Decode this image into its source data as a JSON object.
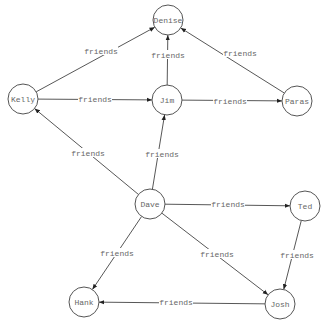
{
  "diagram": {
    "type": "directed-graph",
    "nodes": [
      {
        "id": "denise",
        "label": "Denise",
        "x": 168,
        "y": 20,
        "r": 15
      },
      {
        "id": "kelly",
        "label": "Kelly",
        "x": 23,
        "y": 99,
        "r": 15
      },
      {
        "id": "jim",
        "label": "Jim",
        "x": 167,
        "y": 100,
        "r": 15
      },
      {
        "id": "paras",
        "label": "Paras",
        "x": 297,
        "y": 101,
        "r": 15
      },
      {
        "id": "dave",
        "label": "Dave",
        "x": 150,
        "y": 204,
        "r": 15
      },
      {
        "id": "ted",
        "label": "Ted",
        "x": 305,
        "y": 206,
        "r": 15
      },
      {
        "id": "hank",
        "label": "Hank",
        "x": 84,
        "y": 302,
        "r": 15
      },
      {
        "id": "josh",
        "label": "Josh",
        "x": 280,
        "y": 304,
        "r": 15
      }
    ],
    "edges": [
      {
        "from": "kelly",
        "to": "denise",
        "label": "friends",
        "lx": 101,
        "ly": 51
      },
      {
        "from": "jim",
        "to": "denise",
        "label": "friends",
        "lx": 168,
        "ly": 55
      },
      {
        "from": "paras",
        "to": "denise",
        "label": "friends",
        "lx": 240,
        "ly": 53
      },
      {
        "from": "kelly",
        "to": "jim",
        "label": "friends",
        "lx": 95,
        "ly": 99
      },
      {
        "from": "jim",
        "to": "paras",
        "label": "friends",
        "lx": 230,
        "ly": 101
      },
      {
        "from": "dave",
        "to": "kelly",
        "label": "friends",
        "lx": 88,
        "ly": 153
      },
      {
        "from": "dave",
        "to": "jim",
        "label": "friends",
        "lx": 162,
        "ly": 154
      },
      {
        "from": "dave",
        "to": "ted",
        "label": "friends",
        "lx": 228,
        "ly": 204
      },
      {
        "from": "dave",
        "to": "hank",
        "label": "friends",
        "lx": 117,
        "ly": 253
      },
      {
        "from": "dave",
        "to": "josh",
        "label": "friends",
        "lx": 217,
        "ly": 254
      },
      {
        "from": "ted",
        "to": "josh",
        "label": "friends",
        "lx": 297,
        "ly": 255
      },
      {
        "from": "josh",
        "to": "hank",
        "label": "friends",
        "lx": 176,
        "ly": 302
      }
    ]
  }
}
